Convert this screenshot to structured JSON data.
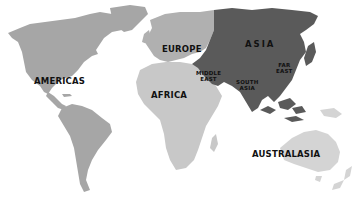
{
  "map": {
    "type": "world-regions",
    "colors": {
      "background": "#ffffff",
      "americas": "#a6a6a6",
      "europe": "#b0b0b0",
      "africa": "#c8c8c8",
      "asia": "#5a5a5a",
      "australasia": "#d4d4d4",
      "label": "#111111"
    },
    "regions": [
      {
        "id": "americas",
        "label": "AMERICAS"
      },
      {
        "id": "europe",
        "label": "EUROPE"
      },
      {
        "id": "africa",
        "label": "AFRICA"
      },
      {
        "id": "asia",
        "label": "ASIA"
      },
      {
        "id": "middle-east",
        "label_line1": "MIDDLE",
        "label_line2": "EAST"
      },
      {
        "id": "south-asia",
        "label_line1": "SOUTH",
        "label_line2": "ASIA"
      },
      {
        "id": "far-east",
        "label_line1": "FAR",
        "label_line2": "EAST"
      },
      {
        "id": "australasia",
        "label": "AUSTRALASIA"
      }
    ]
  }
}
